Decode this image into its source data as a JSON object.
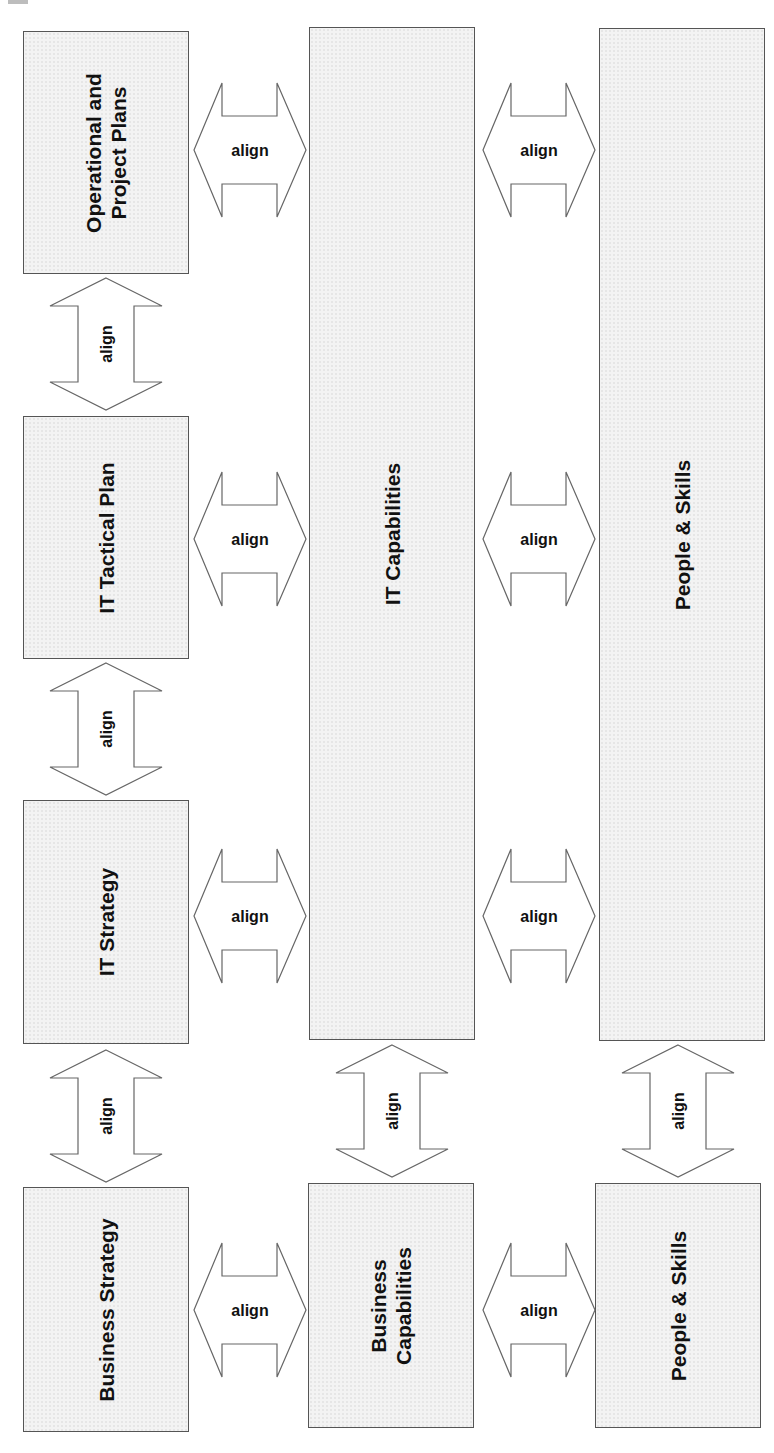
{
  "diagram": {
    "boxes": {
      "operational_plans": "Operational and\nProject Plans",
      "it_tactical_plan": "IT Tactical Plan",
      "it_strategy": "IT Strategy",
      "business_strategy": "Business Strategy",
      "it_capabilities": "IT Capabilities",
      "business_capabilities": "Business\nCapabilities",
      "people_skills_it": "People & Skills",
      "people_skills_business": "People & Skills"
    },
    "arrow_label": "align",
    "colors": {
      "box_fill": "#f3f3f3",
      "border": "#555555",
      "text": "#111111"
    }
  }
}
